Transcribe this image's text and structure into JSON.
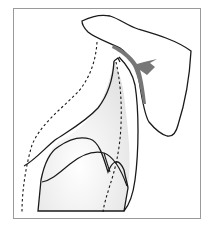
{
  "diagram": {
    "type": "anatomical-illustration",
    "labels": [],
    "colors": {
      "frame": "#9a9a9a",
      "outline": "#1a1a1a",
      "arrow": "#777777",
      "fill_shading": "#e8e8e8"
    },
    "elements": [
      {
        "name": "scapula-outline",
        "style": "solid"
      },
      {
        "name": "humerus-outline",
        "style": "solid"
      },
      {
        "name": "torso-outline",
        "style": "solid"
      },
      {
        "name": "dashed-contour-left",
        "style": "dashed"
      },
      {
        "name": "dashed-contour-right",
        "style": "dashed"
      },
      {
        "name": "movement-arrow",
        "style": "filled-arrow"
      }
    ]
  }
}
